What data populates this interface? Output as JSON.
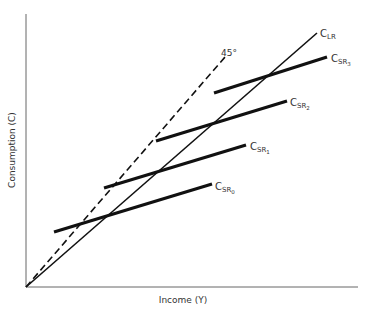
{
  "diagram": {
    "axes": {
      "y_label": "Consumption (C)",
      "x_label": "Income (Y)",
      "origin": [
        26,
        287
      ],
      "y_top": 14,
      "x_right": 358,
      "color": "#555555"
    },
    "reference_line": {
      "label": "45°",
      "style": "dashed",
      "from": [
        26,
        287
      ],
      "to": [
        225,
        57
      ]
    },
    "long_run": {
      "main": "C",
      "sub": "LR",
      "from": [
        26,
        287
      ],
      "to": [
        317,
        33
      ]
    },
    "short_run": [
      {
        "main": "C",
        "sub": "SR",
        "index": "0",
        "from": [
          54,
          232
        ],
        "to": [
          212,
          184
        ],
        "label_at": [
          215,
          190
        ]
      },
      {
        "main": "C",
        "sub": "SR",
        "index": "1",
        "from": [
          104,
          188
        ],
        "to": [
          246,
          145
        ],
        "label_at": [
          250,
          150
        ]
      },
      {
        "main": "C",
        "sub": "SR",
        "index": "2",
        "from": [
          156,
          141
        ],
        "to": [
          287,
          101
        ],
        "label_at": [
          290,
          106
        ]
      },
      {
        "main": "C",
        "sub": "SR",
        "index": "3",
        "from": [
          214,
          93
        ],
        "to": [
          327,
          57
        ],
        "label_at": [
          331,
          62
        ]
      }
    ]
  }
}
